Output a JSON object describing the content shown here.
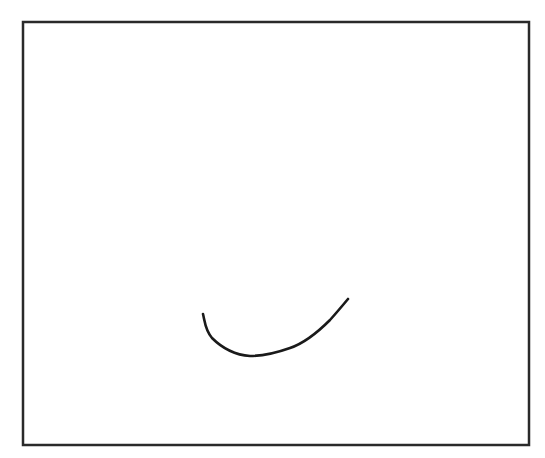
{
  "canvas": {
    "width": 545,
    "height": 458,
    "background": "#ffffff"
  },
  "frame": {
    "x": 23,
    "y": 22,
    "width": 506,
    "height": 423,
    "stroke": "#2a2a2a",
    "stroke_width": 2.5
  },
  "stroke": {
    "description": "freehand curved arc (smile shape)",
    "path": "M 203 314 C 205 322, 205 330, 212 338 C 222 348, 236 355, 250 356 C 262 356, 276 353, 290 348 C 305 343, 318 332, 330 320 C 338 311, 343 305, 348 299",
    "color": "#1a1a1a",
    "width": 2.6
  }
}
